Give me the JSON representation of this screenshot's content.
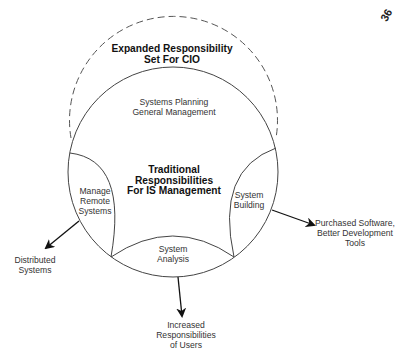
{
  "page_number": "36",
  "diagram": {
    "outer_circle": {
      "style": "dashed",
      "title_lines": [
        "Expanded Responsibility",
        "Set For CIO"
      ]
    },
    "inner_circle": {
      "style": "solid",
      "top_region_lines": [
        "Systems Planning",
        "General Management"
      ],
      "center_title_lines": [
        "Traditional",
        "Responsibilities",
        "For IS Management"
      ]
    },
    "lenses": {
      "left": [
        "Manage",
        "Remote",
        "Systems"
      ],
      "right": [
        "System",
        "Building"
      ],
      "bottom": [
        "System",
        "Analysis"
      ]
    },
    "arrows": {
      "left_target": [
        "Distributed",
        "Systems"
      ],
      "right_target": [
        "Purchased Software,",
        "Better Development",
        "Tools"
      ],
      "bottom_target": [
        "Increased",
        "Responsibilities",
        "of Users"
      ]
    }
  }
}
